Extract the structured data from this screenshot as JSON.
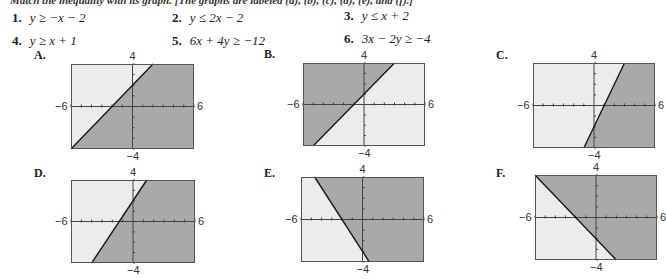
{
  "instruction": "Match the inequality with its graph. [The graphs are labeled (a), (b), (c), (d), (e), and (f).]",
  "inequalities": [
    {
      "num": "1.",
      "expr": "y ≥ −x − 2"
    },
    {
      "num": "2.",
      "expr": "y ≤ 2x − 2"
    },
    {
      "num": "3.",
      "expr": "y ≤ x + 2"
    },
    {
      "num": "4.",
      "expr": "y ≥ x + 1"
    },
    {
      "num": "5.",
      "expr": "6x + 4y ≥ −12"
    },
    {
      "num": "6.",
      "expr": "3x − 2y ≥ −4"
    }
  ],
  "axis_labels": {
    "xmin": "−6",
    "xmax": "6",
    "ymin": "−4",
    "ymax": "4"
  },
  "colors": {
    "shaded": "#a9a9a9",
    "unshaded": "#ececec",
    "line": "#1a1a1a",
    "frame": "#555555"
  },
  "graphs": [
    {
      "label": "A.",
      "slope": 1,
      "intercept": 2,
      "shade": "below"
    },
    {
      "label": "B.",
      "slope": 1,
      "intercept": 1,
      "shade": "above"
    },
    {
      "label": "C.",
      "slope": 2,
      "intercept": -2,
      "shade": "below"
    },
    {
      "label": "D.",
      "slope": 1.5,
      "intercept": 2,
      "shade": "below"
    },
    {
      "label": "E.",
      "slope": -1.5,
      "intercept": -3,
      "shade": "above"
    },
    {
      "label": "F.",
      "slope": -1,
      "intercept": -2,
      "shade": "above"
    }
  ]
}
